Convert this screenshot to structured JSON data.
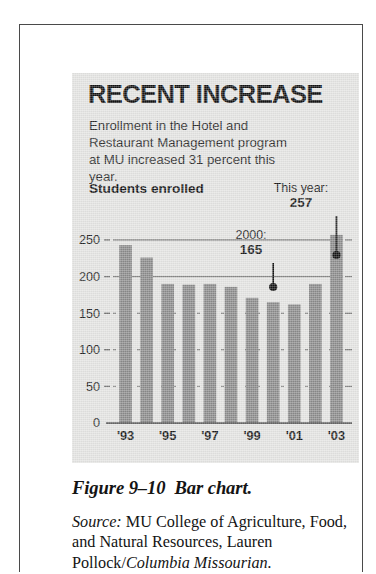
{
  "figure": {
    "headline": "RECENT INCREASE",
    "deck": "Enrollment in the Hotel and Restaurant Management program at MU increased 31 percent this year.",
    "chart_title": "Students enrolled",
    "annotations": {
      "this_year": {
        "label": "This year:",
        "value": "257"
      },
      "year_2000": {
        "label": "2000:",
        "value": "165"
      }
    }
  },
  "caption": {
    "figure_number": "Figure 9–10",
    "figure_title": "Bar chart.",
    "source_label": "Source:",
    "source_text": " MU College of Agriculture, Food, and Natural Resources, Lau­ren Pollock/",
    "source_publication": "Columbia Missourian."
  },
  "colors": {
    "panel_background": "#e3e3e1",
    "bar_fill": "#8a8a8a",
    "axis_line": "#3d3d3d",
    "gridline": "#5a5a5a",
    "text": "#141414"
  },
  "chart_data": {
    "type": "bar",
    "title": "Students enrolled",
    "xlabel": "",
    "ylabel": "",
    "ylim": [
      0,
      260
    ],
    "yticks": [
      0,
      50,
      100,
      150,
      200,
      250
    ],
    "ytick_labels": [
      "0",
      "50",
      "100",
      "150",
      "200",
      "250"
    ],
    "grid": true,
    "grid_axis": "y",
    "legend": false,
    "categories": [
      "1993",
      "1994",
      "1995",
      "1996",
      "1997",
      "1998",
      "1999",
      "2000",
      "2001",
      "2002",
      "2003"
    ],
    "xtick_labels": [
      "'93",
      "",
      "'95",
      "",
      "'97",
      "",
      "'99",
      "",
      "'01",
      "",
      "'03"
    ],
    "values": [
      243,
      226,
      190,
      189,
      190,
      186,
      171,
      165,
      162,
      190,
      257
    ],
    "annotations": [
      {
        "category": "2000",
        "label": "2000:",
        "value": 165
      },
      {
        "category": "2003",
        "label": "This year:",
        "value": 257
      }
    ]
  }
}
